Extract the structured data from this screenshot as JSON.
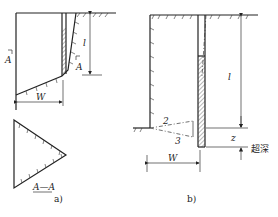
{
  "figure_a": {
    "caption": "a)",
    "section_marker": "A",
    "section_marker_right": "A",
    "section_label": "A—A",
    "depth_label": "l",
    "width_label": "W"
  },
  "figure_b": {
    "caption": "b)",
    "depth_label": "l",
    "width_label": "W",
    "overdepth_symbol": "z",
    "overdepth_label": "超深",
    "line_2": "2",
    "line_3": "3"
  },
  "colors": {
    "ink": "#222222",
    "background": "#ffffff"
  }
}
